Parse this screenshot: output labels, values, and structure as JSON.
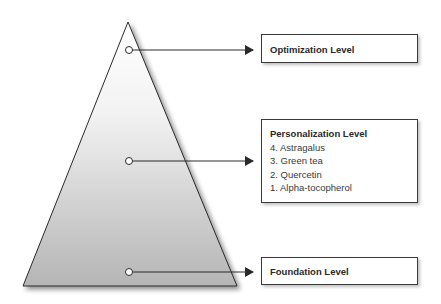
{
  "pyramid": {
    "fill_top": "#ffffff",
    "fill_bottom": "#b8b8b8",
    "stroke": "#2a2a2a"
  },
  "levels": {
    "optimization": {
      "title": "Optimization Level"
    },
    "personalization": {
      "title": "Personalization Level",
      "items": [
        "4. Astragalus",
        "3. Green tea",
        "2. Quercetin",
        "1. Alpha-tocopherol"
      ]
    },
    "foundation": {
      "title": "Foundation Level"
    }
  }
}
